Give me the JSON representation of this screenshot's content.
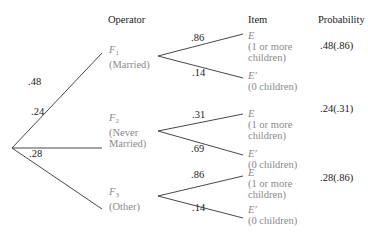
{
  "headers": {
    "operator": "Operator",
    "item": "Item",
    "probability": "Probability"
  },
  "first_branches": [
    {
      "prob": ".48"
    },
    {
      "prob": ".24"
    },
    {
      "prob": ".28"
    }
  ],
  "operators": [
    {
      "symbol": "F",
      "sub": "1",
      "desc_line1": "(Married)",
      "desc_line2": ""
    },
    {
      "symbol": "F",
      "sub": "2",
      "desc_line1": "(Never",
      "desc_line2": "Married)"
    },
    {
      "symbol": "F",
      "sub": "3",
      "desc_line1": "(Other)",
      "desc_line2": ""
    }
  ],
  "second_branches": [
    {
      "upper": ".86",
      "lower": ".14",
      "result": ".48(.86)"
    },
    {
      "upper": ".31",
      "lower": ".69",
      "result": ".24(.31)"
    },
    {
      "upper": ".86",
      "lower": ".14",
      "result": ".28(.86)"
    }
  ],
  "items": {
    "E": {
      "symbol": "E",
      "line1": "(1 or more",
      "line2": "children)"
    },
    "E_prime": {
      "symbol": "E′",
      "line1": "(0 children)"
    }
  },
  "colors": {
    "line": "#333333",
    "label_grey": "#8a8a8a",
    "text": "#222222"
  }
}
